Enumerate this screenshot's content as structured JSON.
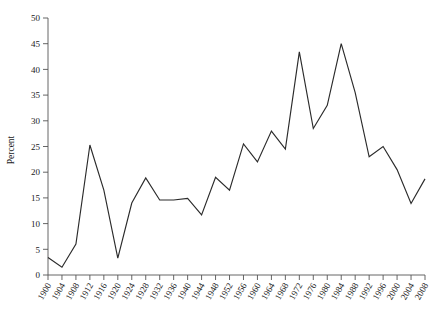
{
  "chart_data": {
    "type": "line",
    "title": "",
    "subtitle": "",
    "xlabel": "",
    "ylabel": "Percent",
    "xlim": [
      1900,
      2008
    ],
    "ylim": [
      0,
      50
    ],
    "ytick_step": 5,
    "xtick_step": 4,
    "grid": false,
    "legend": null,
    "line_color": "#2b2b2b",
    "axis_color": "#555555",
    "categories": [
      "1900",
      "1904",
      "1908",
      "1912",
      "1916",
      "1920",
      "1924",
      "1928",
      "1932",
      "1936",
      "1940",
      "1944",
      "1948",
      "1952",
      "1956",
      "1960",
      "1964",
      "1968",
      "1972",
      "1976",
      "1980",
      "1984",
      "1988",
      "1992",
      "1996",
      "2000",
      "2004",
      "2008"
    ],
    "yticks": [
      "0",
      "5",
      "10",
      "15",
      "20",
      "25",
      "30",
      "35",
      "40",
      "45",
      "50"
    ],
    "series": [
      {
        "name": "Percent",
        "values": [
          3.4,
          1.5,
          6.0,
          25.3,
          16.5,
          3.3,
          14.0,
          18.9,
          14.6,
          14.6,
          14.9,
          11.7,
          19.0,
          16.5,
          25.5,
          22.0,
          28.0,
          24.5,
          43.4,
          28.5,
          33.0,
          45.0,
          35.5,
          23.0,
          25.0,
          20.5,
          13.9,
          18.7
        ]
      }
    ]
  }
}
